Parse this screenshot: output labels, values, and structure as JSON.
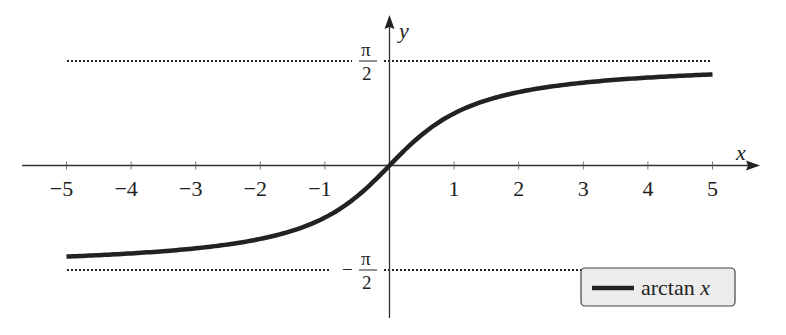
{
  "chart_data": {
    "type": "line",
    "title": "",
    "xlabel": "x",
    "ylabel": "y",
    "xlim": [
      -5.5,
      5.8
    ],
    "ylim": [
      -2.3,
      2.3
    ],
    "x_ticks": [
      -5,
      -4,
      -3,
      -2,
      -1,
      1,
      2,
      3,
      4,
      5
    ],
    "x_tick_labels": [
      "−5",
      "−4",
      "−3",
      "−2",
      "−1",
      "1",
      "2",
      "3",
      "4",
      "5"
    ],
    "y_ticks": [
      1.5708,
      -1.5708
    ],
    "y_tick_labels": [
      "π/2",
      "−π/2"
    ],
    "grid": false,
    "legend_position": "lower right",
    "series": [
      {
        "name": "arctan x",
        "style": "solid",
        "x": [
          -5,
          -4,
          -3,
          -2,
          -1.5,
          -1,
          -0.5,
          0,
          0.5,
          1,
          1.5,
          2,
          3,
          4,
          5
        ],
        "values": [
          -1.3734,
          -1.3258,
          -1.249,
          -1.1071,
          -0.9828,
          -0.7854,
          -0.4636,
          0,
          0.4636,
          0.7854,
          0.9828,
          1.1071,
          1.249,
          1.3258,
          1.3734
        ]
      }
    ],
    "annotations": [
      {
        "type": "asymptote",
        "y": 1.5708,
        "label": "π/2",
        "style": "dotted"
      },
      {
        "type": "asymptote",
        "y": -1.5708,
        "label": "−π/2",
        "style": "dotted"
      }
    ]
  },
  "axes": {
    "x_label": "x",
    "y_label": "y",
    "ticks": [
      "−5",
      "−4",
      "−3",
      "−2",
      "−1",
      "1",
      "2",
      "3",
      "4",
      "5"
    ],
    "pi_num": "π",
    "pi_den": "2",
    "minus": "−"
  },
  "legend": {
    "label_fn": "arctan ",
    "label_var": "x"
  }
}
